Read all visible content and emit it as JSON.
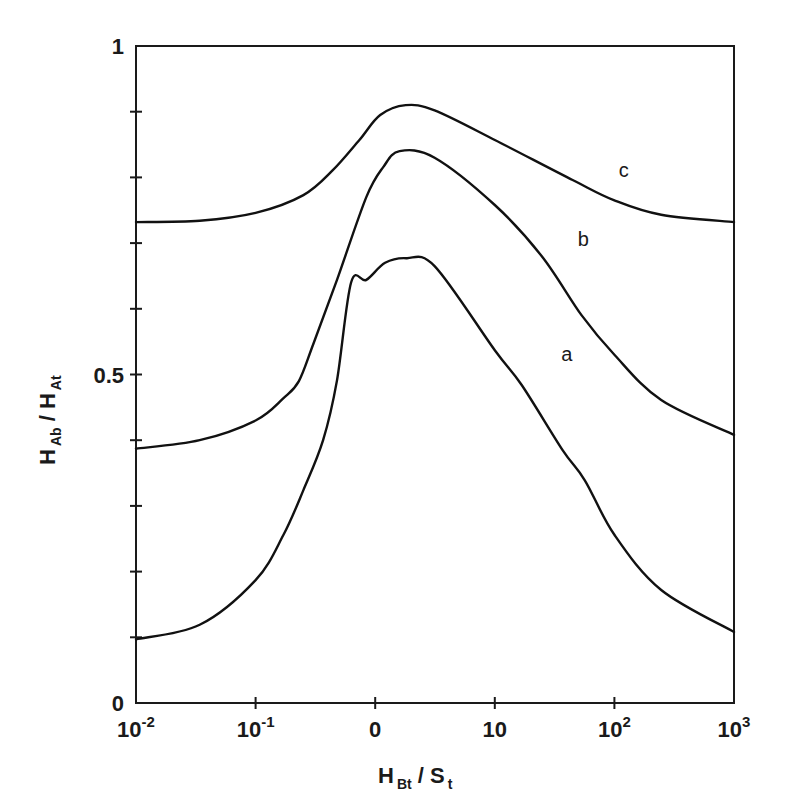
{
  "chart_data": {
    "type": "line",
    "title": "",
    "xlabel": "H_Bt / S_t",
    "ylabel": "H_Ab / H_At",
    "xscale": "log",
    "xlim": [
      0.01,
      1000
    ],
    "ylim": [
      0,
      1
    ],
    "grid": false,
    "legend": "inline labels (a, b, c)",
    "x_ticks": [
      {
        "value": 0.01,
        "label": "10",
        "exp": "-2"
      },
      {
        "value": 0.1,
        "label": "10",
        "exp": "-1"
      },
      {
        "value": 1,
        "label": "0",
        "exp": ""
      },
      {
        "value": 10,
        "label": "10",
        "exp": ""
      },
      {
        "value": 100,
        "label": "10",
        "exp": "2"
      },
      {
        "value": 1000,
        "label": "10",
        "exp": "3"
      }
    ],
    "y_ticks_labeled": [
      {
        "value": 0,
        "label": "0"
      },
      {
        "value": 0.5,
        "label": "0.5"
      },
      {
        "value": 1,
        "label": "1"
      }
    ],
    "y_minor_ticks": [
      0.1,
      0.2,
      0.3,
      0.4,
      0.6,
      0.7,
      0.8,
      0.9
    ],
    "series": [
      {
        "name": "a",
        "label_pos": {
          "x": 40,
          "y": 0.52
        },
        "x": [
          0.01,
          0.0341,
          0.1,
          0.171,
          0.251,
          0.367,
          0.479,
          0.629,
          0.843,
          1.21,
          1.82,
          3.14,
          10,
          16.8,
          36.9,
          56.6,
          100,
          246,
          1000
        ],
        "y": [
          0.097,
          0.119,
          0.187,
          0.256,
          0.324,
          0.4,
          0.491,
          0.64,
          0.644,
          0.67,
          0.677,
          0.665,
          0.537,
          0.484,
          0.385,
          0.339,
          0.256,
          0.172,
          0.108
        ]
      },
      {
        "name": "b",
        "label_pos": {
          "x": 55,
          "y": 0.695
        },
        "x": [
          0.01,
          0.0341,
          0.1,
          0.171,
          0.23,
          0.306,
          0.479,
          0.843,
          1.17,
          1.6,
          3.14,
          10,
          24.7,
          53.3,
          100,
          246,
          1000
        ],
        "y": [
          0.387,
          0.4,
          0.43,
          0.464,
          0.49,
          0.548,
          0.644,
          0.77,
          0.816,
          0.84,
          0.83,
          0.758,
          0.68,
          0.59,
          0.53,
          0.461,
          0.408
        ]
      },
      {
        "name": "c",
        "label_pos": {
          "x": 120,
          "y": 0.8
        },
        "x": [
          0.01,
          0.0341,
          0.1,
          0.251,
          0.442,
          0.738,
          1.1,
          1.8,
          3.14,
          10,
          44.7,
          100,
          246,
          1000
        ],
        "y": [
          0.732,
          0.734,
          0.746,
          0.773,
          0.811,
          0.857,
          0.895,
          0.91,
          0.902,
          0.857,
          0.796,
          0.765,
          0.743,
          0.732
        ]
      }
    ]
  },
  "axes": {
    "x_title_main": "H",
    "x_title_sub1": "Bt",
    "x_title_sep": " / S",
    "x_title_sub2": "t",
    "y_title_main1": "H",
    "y_title_sub1": "Ab",
    "y_title_sep": " / H",
    "y_title_sub2": "At"
  },
  "style": {
    "line_color": "#111111",
    "background": "#ffffff"
  }
}
